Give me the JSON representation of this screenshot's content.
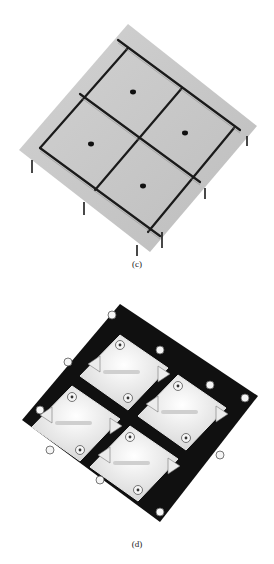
{
  "figure": {
    "panels": [
      {
        "id": "c",
        "label": "(c)",
        "description": "3D surface plot: flat grey tilted plane divided by dark ridges into a 2x2 grid of square cells, each with a dark central dot; edge strips with downward spikes at grid intersections"
      },
      {
        "id": "d",
        "label": "(d)",
        "description": "3D surface plot: white relief structure on black background arranged in 2x2 cells with cross-shaped plateaus, cylindrical pillars and arrow-shaped ridges"
      }
    ],
    "colors": {
      "background": "#ffffff",
      "plane_c": "#c8c8c8",
      "ridge_c": "#1a1a1a",
      "relief_d": "#f2f2f2",
      "shadow_d": "#0d0d0d"
    }
  }
}
